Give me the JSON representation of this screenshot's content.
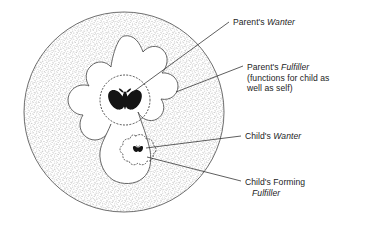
{
  "figure": {
    "type": "conceptual-diagram",
    "colors": {
      "ink": "#1d1d1d",
      "stipple": "#8a8a8a",
      "outline": "#4a4a4a",
      "background": "#ffffff",
      "butterfly": "#111111"
    }
  },
  "labels": {
    "parents_wanter": {
      "lines": [
        {
          "plain": "Parent's ",
          "italic": "Wanter"
        }
      ],
      "text_plain_1": "Parent's ",
      "text_italic_1": "Wanter"
    },
    "parents_fulfiller": {
      "text_plain_1": "Parent's ",
      "text_italic_1": "Fulfiller",
      "text_line_2": "(functions for child as",
      "text_line_3": "well as self)"
    },
    "childs_wanter": {
      "text_plain_1": "Child's ",
      "text_italic_1": "Wanter"
    },
    "childs_forming_fulfiller": {
      "text_line_1": "Child's Forming",
      "text_italic_2": "Fulfiller"
    }
  },
  "elements": {
    "outer_circle_name": "parent-boundary-circle",
    "inner_region_name": "parent-fulfiller-region",
    "large_butterfly_name": "parents-wanter-butterfly",
    "large_dotted_circle_name": "parents-wanter-dotted-boundary",
    "small_butterfly_name": "childs-wanter-butterfly",
    "small_dotted_blob_name": "childs-forming-fulfiller-boundary"
  }
}
